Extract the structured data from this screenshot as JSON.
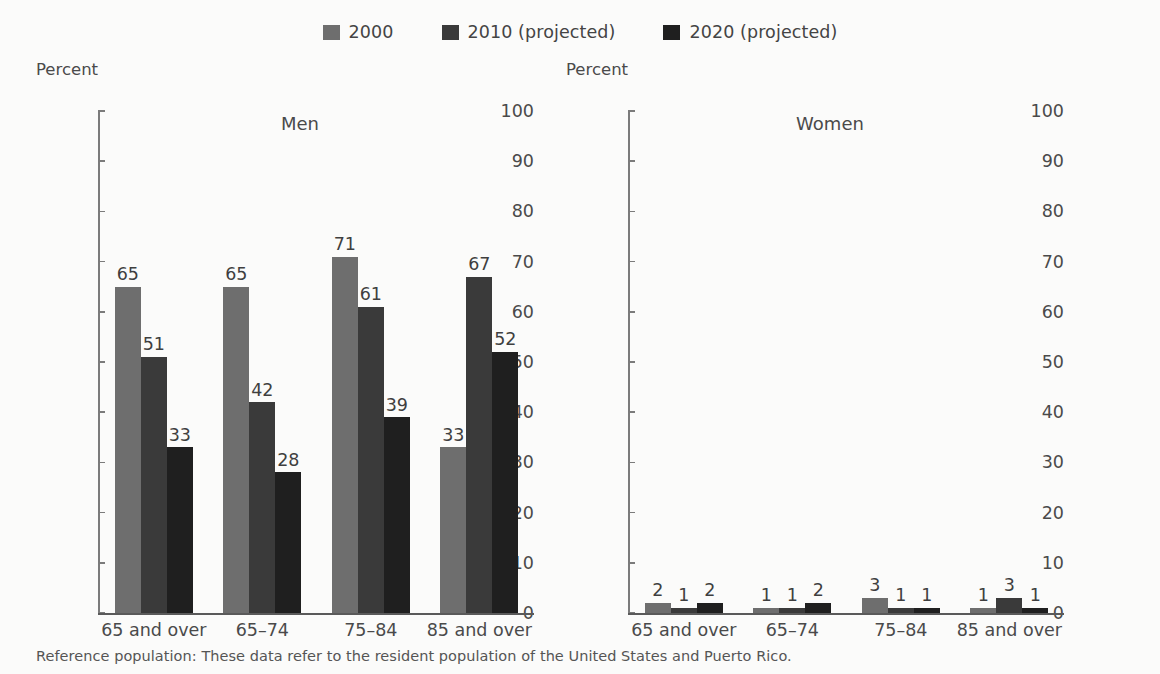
{
  "legend": {
    "items": [
      {
        "label": "2000",
        "color": "#6e6e6e"
      },
      {
        "label": "2010 (projected)",
        "color": "#3a3a3a"
      },
      {
        "label": "2020 (projected)",
        "color": "#1f1f1f"
      }
    ]
  },
  "footnote": "Reference population: These data refer to the resident population of the United States and Puerto Rico.",
  "chart_data": [
    {
      "type": "bar",
      "title": "Men",
      "xlabel": "",
      "ylabel": "Percent",
      "ylim": [
        0,
        100
      ],
      "yticks": [
        0,
        10,
        20,
        30,
        40,
        50,
        60,
        70,
        80,
        90,
        100
      ],
      "grid": false,
      "legend_position": "top-center",
      "categories": [
        "65 and over",
        "65–74",
        "75–84",
        "85 and over"
      ],
      "series": [
        {
          "name": "2000",
          "color": "#6e6e6e",
          "values": [
            65,
            65,
            71,
            33
          ]
        },
        {
          "name": "2010 (projected)",
          "color": "#3a3a3a",
          "values": [
            51,
            42,
            61,
            67
          ]
        },
        {
          "name": "2020 (projected)",
          "color": "#1f1f1f",
          "values": [
            33,
            28,
            39,
            52
          ]
        }
      ]
    },
    {
      "type": "bar",
      "title": "Women",
      "xlabel": "",
      "ylabel": "Percent",
      "ylim": [
        0,
        100
      ],
      "yticks": [
        0,
        10,
        20,
        30,
        40,
        50,
        60,
        70,
        80,
        90,
        100
      ],
      "grid": false,
      "legend_position": "top-center",
      "categories": [
        "65 and over",
        "65–74",
        "75–84",
        "85 and over"
      ],
      "series": [
        {
          "name": "2000",
          "color": "#6e6e6e",
          "values": [
            2,
            1,
            3,
            1
          ]
        },
        {
          "name": "2010 (projected)",
          "color": "#3a3a3a",
          "values": [
            1,
            1,
            1,
            3
          ]
        },
        {
          "name": "2020 (projected)",
          "color": "#1f1f1f",
          "values": [
            2,
            2,
            1,
            1
          ]
        }
      ]
    }
  ]
}
